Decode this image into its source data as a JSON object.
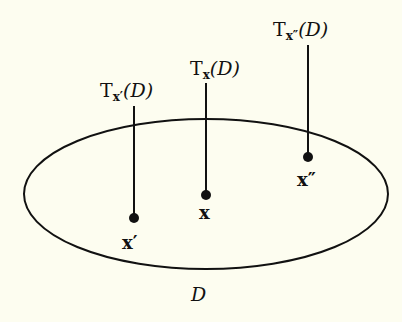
{
  "colors": {
    "background": "#fdfdf0",
    "ink": "#111111"
  },
  "region": {
    "label": "D",
    "cx": 206,
    "cy": 194,
    "rx": 182,
    "ry": 75
  },
  "points": [
    {
      "name": "x-prime",
      "label": "x′",
      "x": 134,
      "y": 218,
      "line_top": 106,
      "tangent_label": {
        "base": "T",
        "sub": "x′",
        "arg": "(D)"
      }
    },
    {
      "name": "x",
      "label": "x",
      "x": 206,
      "y": 195,
      "line_top": 83,
      "tangent_label": {
        "base": "T",
        "sub": "x",
        "arg": "(D)"
      }
    },
    {
      "name": "x-double-prime",
      "label": "x″",
      "x": 308,
      "y": 157,
      "line_top": 45,
      "tangent_label": {
        "base": "T",
        "sub": "x″",
        "arg": "(D)"
      }
    }
  ]
}
